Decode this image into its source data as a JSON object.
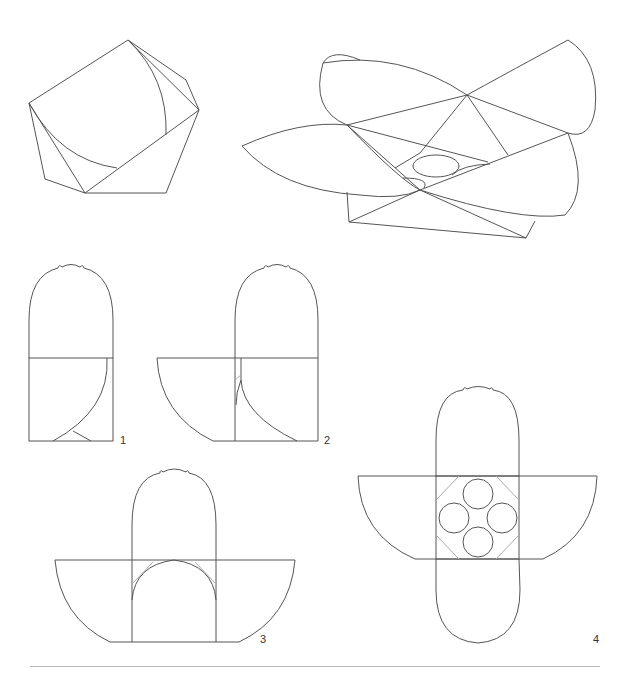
{
  "figure": {
    "colors": {
      "line": "#555555",
      "light_line": "#aaaaaa",
      "rule": "#bbbbbb",
      "background": "#ffffff"
    },
    "views": [
      {
        "id": "assembled-view",
        "label": ""
      },
      {
        "id": "exploded-view",
        "label": ""
      },
      {
        "id": "step-1",
        "label": "1"
      },
      {
        "id": "step-2",
        "label": "2"
      },
      {
        "id": "step-3",
        "label": "3"
      },
      {
        "id": "step-4",
        "label": "4"
      }
    ]
  }
}
